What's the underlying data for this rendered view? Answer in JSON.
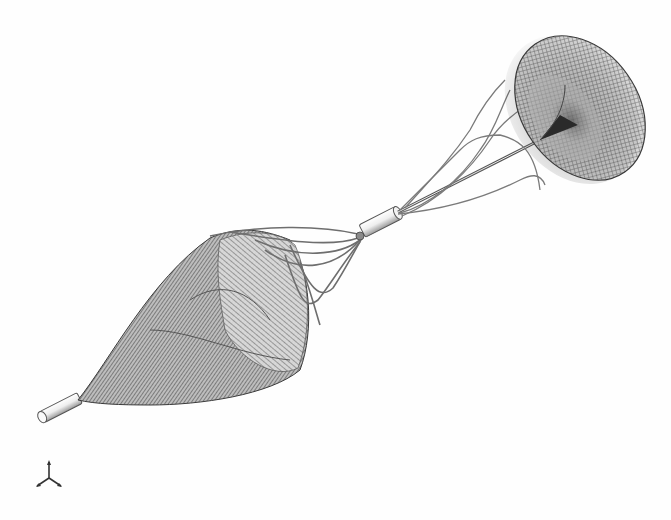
{
  "viewport": {
    "view_type": "3D wireframe render",
    "background_color": "#fefefe"
  },
  "model": {
    "description": "Filter device with conical mesh basket, helical struts, connector tube and toroidal disc mesh",
    "mesh_color": "#4a4a4a",
    "strut_color": "#6e6e6e",
    "tube_color": "#e8e8e8",
    "parts": [
      {
        "name": "distal-tip-tube",
        "icon": "cylinder-icon"
      },
      {
        "name": "conical-mesh-basket",
        "icon": "cone-mesh-icon"
      },
      {
        "name": "basket-struts",
        "icon": "strut-icon"
      },
      {
        "name": "connector-tube",
        "icon": "cylinder-icon"
      },
      {
        "name": "helical-struts",
        "icon": "helix-icon"
      },
      {
        "name": "shaft",
        "icon": "line-icon"
      },
      {
        "name": "toroidal-disc-mesh",
        "icon": "torus-mesh-icon"
      }
    ]
  },
  "triad": {
    "icon": "axis-triad-icon",
    "axes": [
      "Y",
      "X",
      "Z"
    ]
  }
}
